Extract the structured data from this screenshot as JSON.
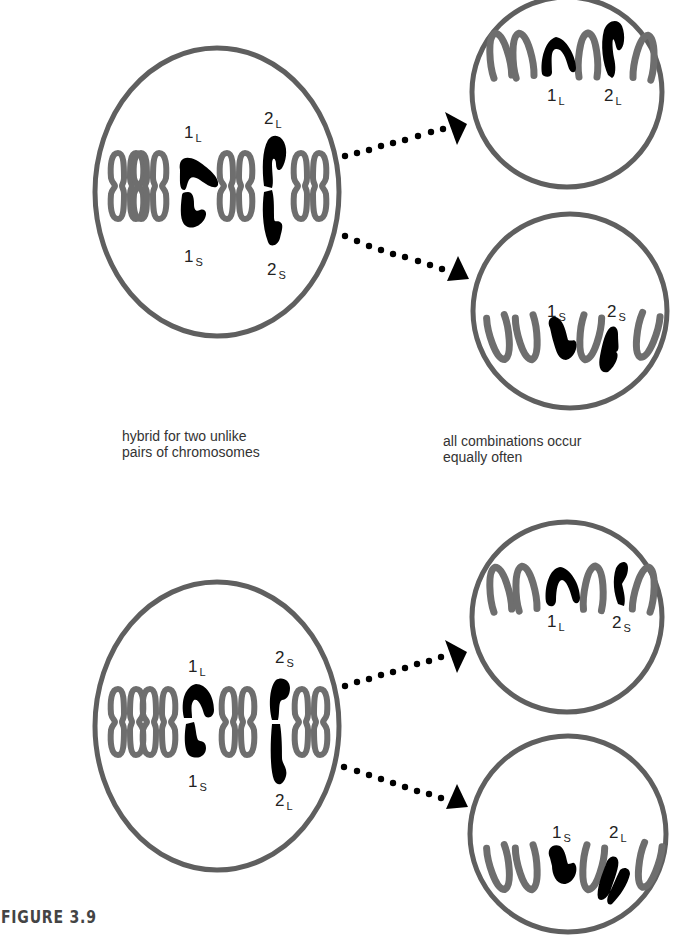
{
  "figure": {
    "label": "FIGURE 3.9",
    "colors": {
      "cell_outline": "#5f5f5f",
      "gray_chromosome": "#6e6e6e",
      "marked_chromosome": "#000000",
      "arrow": "#000000"
    },
    "panels": [
      {
        "name": "top",
        "parent_cell": {
          "labels": {
            "pair1_top": {
              "num": "1",
              "sub": "L"
            },
            "pair1_bottom": {
              "num": "1",
              "sub": "S"
            },
            "pair2_top": {
              "num": "2",
              "sub": "L"
            },
            "pair2_bottom": {
              "num": "2",
              "sub": "S"
            }
          }
        },
        "daughter_upper": {
          "labels": [
            {
              "num": "1",
              "sub": "L"
            },
            {
              "num": "2",
              "sub": "L"
            }
          ]
        },
        "daughter_lower": {
          "labels": [
            {
              "num": "1",
              "sub": "S"
            },
            {
              "num": "2",
              "sub": "S"
            }
          ]
        }
      },
      {
        "name": "bottom",
        "parent_cell": {
          "labels": {
            "pair1_top": {
              "num": "1",
              "sub": "L"
            },
            "pair1_bottom": {
              "num": "1",
              "sub": "S"
            },
            "pair2_top": {
              "num": "2",
              "sub": "S"
            },
            "pair2_bottom": {
              "num": "2",
              "sub": "L"
            }
          }
        },
        "daughter_upper": {
          "labels": [
            {
              "num": "1",
              "sub": "L"
            },
            {
              "num": "2",
              "sub": "S"
            }
          ]
        },
        "daughter_lower": {
          "labels": [
            {
              "num": "1",
              "sub": "S"
            },
            {
              "num": "2",
              "sub": "L"
            }
          ]
        }
      }
    ],
    "captions": {
      "left": {
        "line1": "hybrid for two unlike",
        "line2": "pairs of chromosomes"
      },
      "right": {
        "line1": "all combinations occur",
        "line2": "equally often"
      }
    }
  }
}
